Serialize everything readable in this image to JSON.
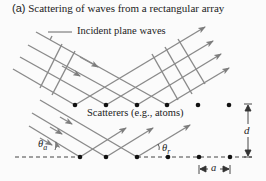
{
  "figure": {
    "tag": "(a)",
    "title": "Scattering of waves from a rectangular array",
    "labels": {
      "incident": "Incident plane waves",
      "scatterers": "Scatterers (e.g., atoms)",
      "theta_a": "θa",
      "theta_a_main": "θ",
      "theta_a_sub": "a",
      "theta_r_main": "θ",
      "theta_r_sub": "r",
      "d": "d",
      "a": "a"
    },
    "colors": {
      "ray": "#8a8a8a",
      "dot": "#111111",
      "text": "#222222"
    }
  }
}
